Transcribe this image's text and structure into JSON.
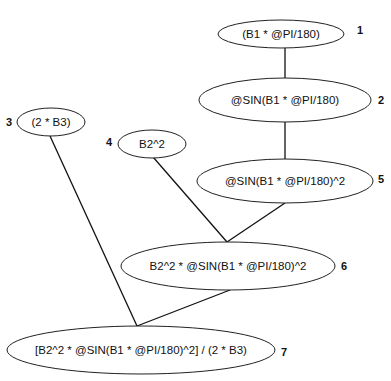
{
  "diagram": {
    "type": "expression-tree",
    "nodes": [
      {
        "id": "1",
        "number": "1",
        "label": "(B1 * @PI/180)",
        "cx": 281,
        "cy": 34,
        "rx": 63,
        "ry": 14,
        "num_x": 357,
        "num_y": 30
      },
      {
        "id": "2",
        "number": "2",
        "label": "@SIN(B1 * @PI/180)",
        "cx": 285,
        "cy": 100,
        "rx": 86,
        "ry": 22,
        "num_x": 378,
        "num_y": 100
      },
      {
        "id": "3",
        "number": "3",
        "label": "(2 * B3)",
        "cx": 51,
        "cy": 122,
        "rx": 34,
        "ry": 14,
        "num_x": 6,
        "num_y": 122
      },
      {
        "id": "4",
        "number": "4",
        "label": "B2^2",
        "cx": 152,
        "cy": 144,
        "rx": 34,
        "ry": 14,
        "num_x": 106,
        "num_y": 142
      },
      {
        "id": "5",
        "number": "5",
        "label": "@SIN(B1 * @PI/180)^2",
        "cx": 285,
        "cy": 181,
        "rx": 88,
        "ry": 22,
        "num_x": 378,
        "num_y": 179
      },
      {
        "id": "6",
        "number": "6",
        "label": "B2^2 * @SIN(B1 * @PI/180)^2",
        "cx": 228,
        "cy": 266,
        "rx": 107,
        "ry": 24,
        "num_x": 341,
        "num_y": 266
      },
      {
        "id": "7",
        "number": "7",
        "label": "[B2^2 * @SIN(B1 * @PI/180)^2] / (2 * B3)",
        "cx": 141,
        "cy": 350,
        "rx": 134,
        "ry": 24,
        "num_x": 281,
        "num_y": 352
      }
    ],
    "edges": [
      {
        "from": "1",
        "to": "2",
        "x1": 285,
        "y1": 47,
        "x2": 285,
        "y2": 78
      },
      {
        "from": "2",
        "to": "5",
        "x1": 285,
        "y1": 122,
        "x2": 285,
        "y2": 159
      },
      {
        "from": "4",
        "to": "6",
        "x1": 153,
        "y1": 157,
        "x2": 227,
        "y2": 242
      },
      {
        "from": "5",
        "to": "6",
        "x1": 285,
        "y1": 203,
        "x2": 227,
        "y2": 242
      },
      {
        "from": "3",
        "to": "7",
        "x1": 50,
        "y1": 136,
        "x2": 137,
        "y2": 326
      },
      {
        "from": "6",
        "to": "7",
        "x1": 230,
        "y1": 290,
        "x2": 137,
        "y2": 326
      }
    ]
  }
}
